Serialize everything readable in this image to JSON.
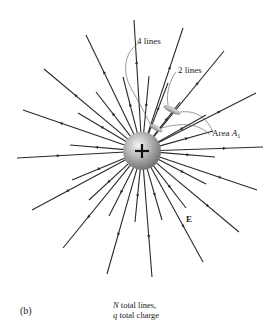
{
  "figure": {
    "panel_label": "(b)",
    "caption_line1_var": "N",
    "caption_line1_rest": " total lines,",
    "caption_line2_var": "q",
    "caption_line2_rest": " total charge",
    "charge_symbol": "+",
    "field_label": "E",
    "label_4_lines": "4 lines",
    "label_2_lines": "2 lines",
    "label_area_prefix": "Area ",
    "label_area_var": "A",
    "label_area_sub": "1"
  },
  "geometry": {
    "center": [
      142,
      151
    ],
    "charge_radius": 19,
    "line_color": "#2a2a2a",
    "long_line_ends": [
      [
        134,
        20
      ],
      [
        183,
        28
      ],
      [
        224,
        51
      ],
      [
        256,
        93
      ],
      [
        263,
        147
      ],
      [
        257,
        190
      ],
      [
        239,
        232
      ],
      [
        203,
        262
      ],
      [
        152,
        277
      ],
      [
        107,
        274
      ],
      [
        63,
        248
      ],
      [
        32,
        210
      ],
      [
        17,
        158
      ],
      [
        23,
        110
      ],
      [
        44,
        69
      ],
      [
        86,
        35
      ]
    ],
    "short_line_ends": [
      [
        123,
        77
      ],
      [
        149,
        76
      ],
      [
        168,
        83
      ],
      [
        180,
        102
      ],
      [
        206,
        115
      ],
      [
        213,
        131
      ],
      [
        215,
        157
      ],
      [
        206,
        184
      ],
      [
        186,
        208
      ],
      [
        162,
        220
      ],
      [
        135,
        222
      ],
      [
        109,
        216
      ],
      [
        89,
        200
      ],
      [
        72,
        180
      ],
      [
        70,
        145
      ],
      [
        78,
        113
      ],
      [
        96,
        92
      ]
    ],
    "areas": [
      {
        "cx": 172,
        "cy": 110,
        "rx": 9,
        "ry": 2.6,
        "angle": 25
      },
      {
        "cx": 156,
        "cy": 128,
        "rx": 7,
        "ry": 2.2,
        "angle": 30
      }
    ]
  }
}
